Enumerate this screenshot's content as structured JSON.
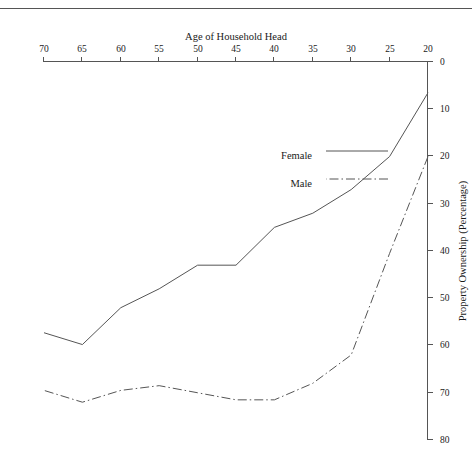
{
  "chart_data": {
    "type": "line",
    "title": "",
    "xlabel": "Age of Household Head",
    "ylabel": "Property Ownership (Percentage)",
    "x": [
      20,
      25,
      30,
      35,
      40,
      45,
      50,
      55,
      60,
      65,
      70
    ],
    "xlim": [
      20,
      70
    ],
    "ylim": [
      0,
      80
    ],
    "xticks": [
      20,
      25,
      30,
      35,
      40,
      45,
      50,
      55,
      60,
      65,
      70
    ],
    "yticks": [
      0,
      10,
      20,
      30,
      40,
      50,
      60,
      70,
      80
    ],
    "grid": false,
    "legend_position": "upper left",
    "rotation_degrees": 180,
    "series": [
      {
        "name": "Female",
        "style": "solid",
        "color": "#555555",
        "values": [
          6.5,
          20.0,
          27.0,
          32.0,
          35.0,
          43.0,
          43.0,
          48.0,
          52.0,
          59.8,
          57.3
        ]
      },
      {
        "name": "Male",
        "style": "dash-dot",
        "color": "#555555",
        "values": [
          20.0,
          40.5,
          62.0,
          68.0,
          71.5,
          71.5,
          70.0,
          68.5,
          69.5,
          72.0,
          69.5
        ]
      }
    ]
  },
  "axes": {
    "x_tick_labels": [
      "20",
      "25",
      "30",
      "35",
      "40",
      "45",
      "50",
      "55",
      "60",
      "65",
      "70"
    ],
    "y_tick_labels": [
      "0",
      "10",
      "20",
      "30",
      "40",
      "50",
      "60",
      "70",
      "80"
    ],
    "x_title": "Age of Household Head",
    "y_title": "Property Ownership (Percentage)"
  },
  "legend": {
    "entries": [
      {
        "label": "Male",
        "style": "dash-dot"
      },
      {
        "label": "Female",
        "style": "solid"
      }
    ]
  },
  "colors": {
    "line": "#555555",
    "axis": "#555555",
    "background": "#ffffff",
    "text": "#1a1a1a"
  }
}
